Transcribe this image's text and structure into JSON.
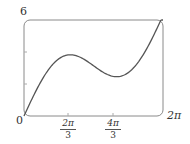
{
  "chart_data": {
    "type": "line",
    "title": "",
    "xlabel": "",
    "ylabel": "",
    "function": "f(x) = x + 2 sin(x)",
    "xlim": [
      0,
      6.2832
    ],
    "ylim": [
      0,
      6
    ],
    "grid": false,
    "legend": null,
    "frame": "rounded-box",
    "x_ticks": [
      {
        "value": 2.0944,
        "label_num": "2π",
        "label_den": "3"
      },
      {
        "value": 4.1888,
        "label_num": "4π",
        "label_den": "3"
      }
    ],
    "x_end_label": "2π",
    "origin_label": "0",
    "y_ticks": [
      2,
      4
    ],
    "y_top_label": "6",
    "series": [
      {
        "name": "f(x)",
        "x": [
          0,
          0.3927,
          0.7854,
          1.1781,
          1.5708,
          1.9635,
          2.0944,
          2.3562,
          2.7489,
          3.1416,
          3.5343,
          3.927,
          4.1888,
          4.3197,
          4.7124,
          5.1051,
          5.4978,
          5.8905,
          6.2832
        ],
        "values": [
          0,
          1.158,
          2.2,
          3.026,
          3.571,
          3.811,
          3.826,
          3.77,
          3.514,
          3.142,
          2.769,
          2.513,
          2.457,
          2.472,
          2.712,
          3.257,
          4.083,
          5.125,
          6.283
        ]
      }
    ],
    "annotations": {
      "local_max": {
        "x": 2.0944,
        "y": 3.826
      },
      "local_min": {
        "x": 4.1888,
        "y": 2.457
      }
    }
  },
  "labels": {
    "y_top": "6",
    "origin": "0",
    "x_end": "2π",
    "tick1_num": "2π",
    "tick1_den": "3",
    "tick2_num": "4π",
    "tick2_den": "3"
  },
  "colors": {
    "curve": "#555555",
    "frame": "#888888"
  }
}
